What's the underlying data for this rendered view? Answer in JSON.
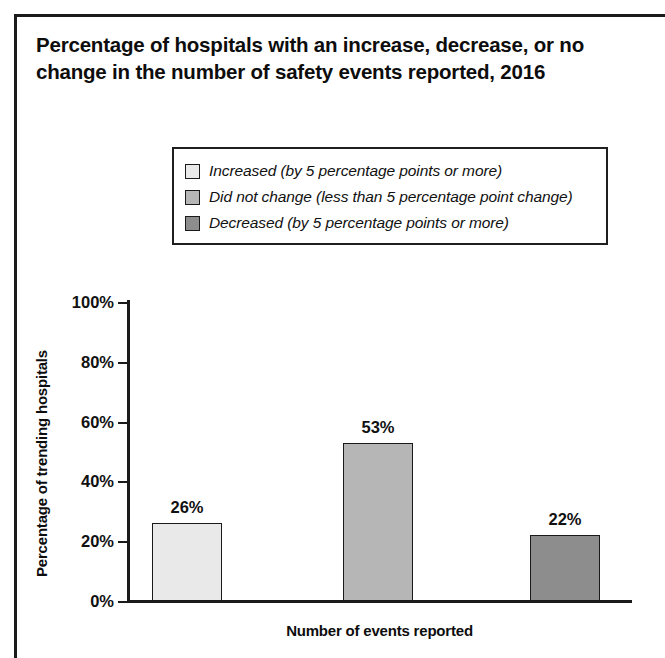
{
  "chart_data": {
    "type": "bar",
    "title": "Percentage of hospitals with an increase, decrease, or no change in the number of safety events reported, 2016",
    "xlabel": "Number of events reported",
    "ylabel": "Percentage of trending hospitals",
    "ylim": [
      0,
      100
    ],
    "grid": false,
    "legend_position": "top-center",
    "ytick_labels": [
      "100%",
      "80%",
      "60%",
      "40%",
      "20%",
      "0%"
    ],
    "ytick_values": [
      100,
      80,
      60,
      40,
      20,
      0
    ],
    "categories": [
      "Increased (by 5 percentage points or more)",
      "Did not change (less than 5 percentage point change)",
      "Decreased (by 5 percentage points or more)"
    ],
    "values": [
      26,
      53,
      22
    ],
    "value_labels": [
      "26%",
      "53%",
      "22%"
    ],
    "bar_colors": [
      "#e9e9e9",
      "#b6b6b6",
      "#8d8d8d"
    ],
    "bars": [
      {
        "label": "Increased (by 5 percentage points or more)",
        "value": 26,
        "value_label": "26%",
        "color": "#e9e9e9"
      },
      {
        "label": "Did not change (less than 5 percentage point change)",
        "value": 53,
        "value_label": "53%",
        "color": "#b6b6b6"
      },
      {
        "label": "Decreased (by 5 percentage points or more)",
        "value": 22,
        "value_label": "22%",
        "color": "#8d8d8d"
      }
    ],
    "legend": [
      {
        "label": "Increased (by 5 percentage points or more)",
        "color": "#e9e9e9"
      },
      {
        "label": "Did not change (less than 5 percentage point change)",
        "color": "#b6b6b6"
      },
      {
        "label": "Decreased (by 5 percentage points or more)",
        "color": "#8d8d8d"
      }
    ]
  }
}
